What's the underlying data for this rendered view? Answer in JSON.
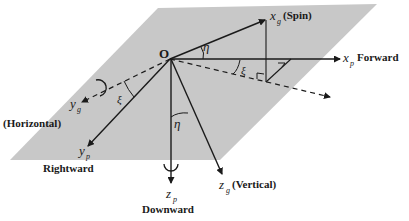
{
  "diagram": {
    "title": "",
    "plane_color": "#c8c8c8",
    "line_color": "#1a1a1a",
    "origin": {
      "label": "O"
    },
    "axes": [
      {
        "id": "xg",
        "symbol": "x",
        "subscript": "g",
        "label": "(Spin)"
      },
      {
        "id": "xp",
        "symbol": "x",
        "subscript": "p",
        "label": "Forward"
      },
      {
        "id": "yg",
        "symbol": "y",
        "subscript": "g",
        "label": "(Horizontal)"
      },
      {
        "id": "yp",
        "symbol": "y",
        "subscript": "p",
        "label": "Rightward"
      },
      {
        "id": "zp",
        "symbol": "z",
        "subscript": "p",
        "label": "Downward"
      },
      {
        "id": "zg",
        "symbol": "z",
        "subscript": "g",
        "label": "(Vertical)"
      }
    ],
    "angles": [
      {
        "id": "eta-top",
        "symbol": "η"
      },
      {
        "id": "xi-right",
        "symbol": "ξ"
      },
      {
        "id": "xi-left",
        "symbol": "ξ"
      },
      {
        "id": "eta-bottom",
        "symbol": "η"
      }
    ]
  }
}
